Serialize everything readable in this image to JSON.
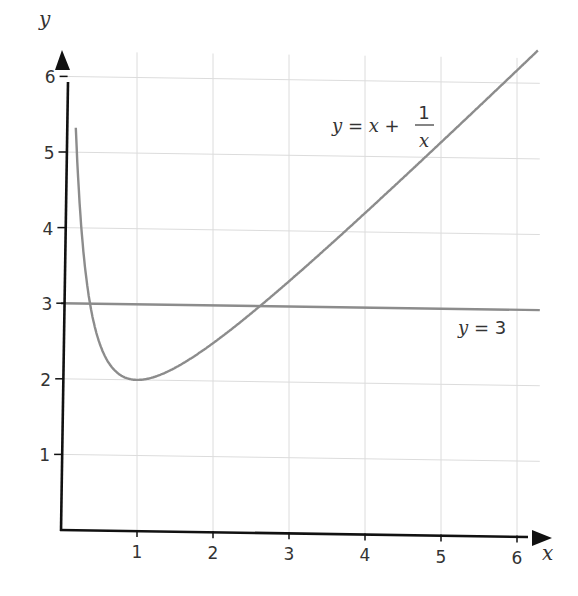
{
  "chart_data": {
    "type": "line",
    "title": "",
    "xlabel": "x",
    "ylabel": "y",
    "xlim": [
      0,
      6.3
    ],
    "ylim": [
      0,
      6.3
    ],
    "x_ticks": [
      "1",
      "2",
      "3",
      "4",
      "5",
      "6"
    ],
    "y_ticks": [
      "1",
      "2",
      "3",
      "4",
      "5",
      "6"
    ],
    "grid": true,
    "legend": "none (inline curve labels)",
    "series": [
      {
        "name": "y = x + 1/x",
        "label_parts": {
          "lhs": "y",
          "eq": " = ",
          "x": "x",
          "plus": " + ",
          "num": "1",
          "den": "x"
        },
        "color": "#8c8c8c",
        "x": [
          0.2,
          0.25,
          0.3,
          0.4,
          0.5,
          0.6,
          0.8,
          1.0,
          1.5,
          2.0,
          2.5,
          3.0,
          4.0,
          5.0,
          6.0,
          6.2
        ],
        "y": [
          5.2,
          4.25,
          3.63,
          2.9,
          2.5,
          2.27,
          2.05,
          2.0,
          2.17,
          2.5,
          2.9,
          3.33,
          4.25,
          5.2,
          6.17,
          6.36
        ]
      },
      {
        "name": "y = 3",
        "label_parts": {
          "lhs": "y",
          "eq": " = ",
          "rhs": "3"
        },
        "color": "#8c8c8c",
        "x": [
          0,
          6.3
        ],
        "y": [
          3,
          3
        ]
      }
    ],
    "intersections": [
      {
        "x": 0.38,
        "y": 3
      },
      {
        "x": 2.62,
        "y": 3
      }
    ],
    "minimum": {
      "x": 1,
      "y": 2
    }
  },
  "colors": {
    "axis": "#111111",
    "grid": "#dcdcdc",
    "curve": "#8c8c8c",
    "text": "#333333"
  }
}
